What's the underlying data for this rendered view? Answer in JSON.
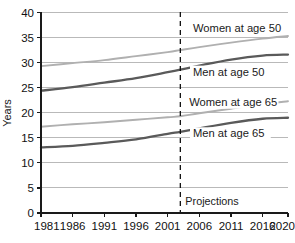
{
  "chart_data": {
    "type": "line",
    "title": "",
    "xlabel": "",
    "ylabel": "Years",
    "xlim": [
      1981,
      2020
    ],
    "ylim": [
      0,
      40
    ],
    "ytick_step": 5,
    "grid": true,
    "legend_position": "inline-labels",
    "x_ticks": [
      "1981",
      "1986",
      "1991",
      "1996",
      "2001",
      "2006",
      "2011",
      "2016",
      "2020"
    ],
    "x_tick_values": [
      1981,
      1986,
      1991,
      1996,
      2001,
      2006,
      2011,
      2016,
      2020
    ],
    "y_ticks": [
      "0",
      "5",
      "10",
      "15",
      "20",
      "25",
      "30",
      "35",
      "40"
    ],
    "y_tick_values": [
      0,
      5,
      10,
      15,
      20,
      25,
      30,
      35,
      40
    ],
    "annotations": [
      {
        "name": "projections-divider",
        "label": "Projections",
        "x_value": 2003,
        "style": "dashed-vertical-line"
      }
    ],
    "x": [
      1981,
      1986,
      1991,
      1996,
      2001,
      2003,
      2006,
      2011,
      2016,
      2020
    ],
    "series": [
      {
        "name": "Women at age 50",
        "color": "#b0b0b0",
        "weight": "light",
        "values": [
          29.3,
          29.9,
          30.5,
          31.3,
          32.1,
          32.5,
          33.1,
          34.0,
          34.8,
          35.3
        ]
      },
      {
        "name": "Men at age 50",
        "color": "#5a5a5a",
        "weight": "dark",
        "values": [
          24.4,
          25.1,
          26.0,
          26.9,
          28.1,
          28.6,
          29.4,
          30.6,
          31.4,
          31.6
        ]
      },
      {
        "name": "Women at age 65",
        "color": "#b0b0b0",
        "weight": "light",
        "values": [
          17.2,
          17.7,
          18.1,
          18.6,
          19.1,
          19.3,
          19.9,
          20.8,
          21.7,
          22.3
        ]
      },
      {
        "name": "Men at age 65",
        "color": "#5a5a5a",
        "weight": "dark",
        "values": [
          13.1,
          13.4,
          14.0,
          14.7,
          15.8,
          16.2,
          16.9,
          18.0,
          18.8,
          19.0
        ]
      }
    ],
    "series_labels": [
      {
        "text": "Women at age 50",
        "x_value": 2005.0,
        "y_value": 36.3
      },
      {
        "text": "Men at age 50",
        "x_value": 2005.0,
        "y_value": 27.6
      },
      {
        "text": "Women at age 65",
        "x_value": 2004.4,
        "y_value": 21.6
      },
      {
        "text": "Men at age 65",
        "x_value": 2005.0,
        "y_value": 15.3
      }
    ]
  }
}
